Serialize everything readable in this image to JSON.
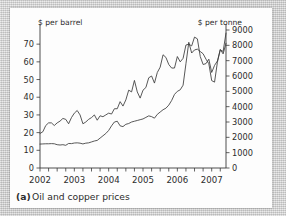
{
  "figure": {
    "caption_marker": "(a)",
    "caption_text": "Oil and copper prices"
  },
  "chart_data": {
    "type": "line",
    "title": "",
    "subtitle": "",
    "xlabel": "",
    "ylabel": "$ per barrel",
    "y2label": "$ per tonne",
    "left_axis": {
      "label": "$ per barrel",
      "ticks": [
        0,
        10,
        20,
        30,
        40,
        50,
        60,
        70
      ],
      "ylim": [
        0,
        78
      ]
    },
    "right_axis": {
      "label": "$ per tonne",
      "ticks": [
        0,
        1000,
        2000,
        3000,
        4000,
        5000,
        6000,
        7000,
        8000,
        9000
      ],
      "ylim": [
        0,
        9000
      ]
    },
    "x_axis": {
      "tick_labels": [
        "2002",
        "2003",
        "2004",
        "2005",
        "2006",
        "2007"
      ],
      "minor_tick_interval": "quarterly",
      "xlim": [
        "2002-01",
        "2007-07"
      ]
    },
    "grid": false,
    "legend": "none",
    "series": [
      {
        "name": "Oil price",
        "axis": "left",
        "units": "$ per barrel",
        "x": [
          "2002-01",
          "2002-02",
          "2002-03",
          "2002-04",
          "2002-05",
          "2002-06",
          "2002-07",
          "2002-08",
          "2002-09",
          "2002-10",
          "2002-11",
          "2002-12",
          "2003-01",
          "2003-02",
          "2003-03",
          "2003-04",
          "2003-05",
          "2003-06",
          "2003-07",
          "2003-08",
          "2003-09",
          "2003-10",
          "2003-11",
          "2003-12",
          "2004-01",
          "2004-02",
          "2004-03",
          "2004-04",
          "2004-05",
          "2004-06",
          "2004-07",
          "2004-08",
          "2004-09",
          "2004-10",
          "2004-11",
          "2004-12",
          "2005-01",
          "2005-02",
          "2005-03",
          "2005-04",
          "2005-05",
          "2005-06",
          "2005-07",
          "2005-08",
          "2005-09",
          "2005-10",
          "2005-11",
          "2005-12",
          "2006-01",
          "2006-02",
          "2006-03",
          "2006-04",
          "2006-05",
          "2006-06",
          "2006-07",
          "2006-08",
          "2006-09",
          "2006-10",
          "2006-11",
          "2006-12",
          "2007-01",
          "2007-02",
          "2007-03",
          "2007-04",
          "2007-05",
          "2007-06"
        ],
        "values": [
          19.5,
          20.5,
          24.0,
          25.5,
          25.5,
          24.0,
          25.5,
          26.5,
          28.0,
          27.5,
          25.0,
          28.5,
          31.0,
          32.5,
          30.0,
          25.0,
          26.0,
          27.5,
          28.5,
          30.0,
          27.0,
          29.5,
          29.0,
          30.0,
          31.0,
          30.5,
          33.5,
          33.5,
          37.5,
          35.0,
          38.5,
          44.0,
          43.0,
          49.5,
          43.0,
          39.5,
          44.0,
          45.5,
          51.0,
          52.0,
          48.0,
          54.0,
          57.0,
          64.0,
          62.5,
          58.5,
          56.5,
          56.5,
          63.0,
          60.0,
          62.0,
          69.5,
          70.0,
          69.0,
          74.0,
          73.0,
          63.0,
          58.5,
          59.0,
          61.5,
          54.0,
          58.0,
          60.5,
          67.0,
          64.5,
          70.5
        ]
      },
      {
        "name": "Copper price",
        "axis": "right",
        "units": "$ per tonne",
        "x": [
          "2002-01",
          "2002-02",
          "2002-03",
          "2002-04",
          "2002-05",
          "2002-06",
          "2002-07",
          "2002-08",
          "2002-09",
          "2002-10",
          "2002-11",
          "2002-12",
          "2003-01",
          "2003-02",
          "2003-03",
          "2003-04",
          "2003-05",
          "2003-06",
          "2003-07",
          "2003-08",
          "2003-09",
          "2003-10",
          "2003-11",
          "2003-12",
          "2004-01",
          "2004-02",
          "2004-03",
          "2004-04",
          "2004-05",
          "2004-06",
          "2004-07",
          "2004-08",
          "2004-09",
          "2004-10",
          "2004-11",
          "2004-12",
          "2005-01",
          "2005-02",
          "2005-03",
          "2005-04",
          "2005-05",
          "2005-06",
          "2005-07",
          "2005-08",
          "2005-09",
          "2005-10",
          "2005-11",
          "2005-12",
          "2006-01",
          "2006-02",
          "2006-03",
          "2006-04",
          "2006-05",
          "2006-06",
          "2006-07",
          "2006-08",
          "2006-09",
          "2006-10",
          "2006-11",
          "2006-12",
          "2007-01",
          "2007-02",
          "2007-03",
          "2007-04",
          "2007-05",
          "2007-06"
        ],
        "values": [
          1560,
          1570,
          1580,
          1580,
          1590,
          1580,
          1520,
          1500,
          1520,
          1480,
          1600,
          1590,
          1630,
          1640,
          1620,
          1570,
          1620,
          1640,
          1700,
          1760,
          1800,
          1950,
          2100,
          2250,
          2450,
          2750,
          3000,
          3050,
          2750,
          2700,
          2850,
          2900,
          3000,
          3050,
          3100,
          3150,
          3200,
          3300,
          3400,
          3350,
          3250,
          3500,
          3650,
          3800,
          3900,
          4100,
          4400,
          4800,
          5000,
          5100,
          5400,
          6800,
          8200,
          7500,
          7700,
          7750,
          7600,
          7450,
          7100,
          6800,
          5700,
          5600,
          6900,
          7700,
          7600,
          8800
        ]
      }
    ]
  }
}
